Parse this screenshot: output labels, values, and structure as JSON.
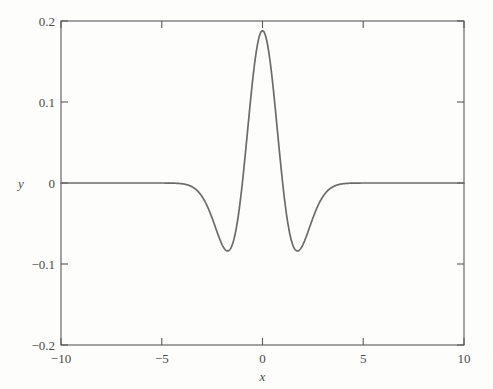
{
  "chart_data": {
    "type": "line",
    "title": "",
    "subtitle": "",
    "xlabel": "x",
    "ylabel": "y",
    "xlim": [
      -10,
      10
    ],
    "ylim": [
      -0.2,
      0.2
    ],
    "xticks": [
      -10,
      -5,
      0,
      5,
      10
    ],
    "xticklabels": [
      "−10",
      "−5",
      "0",
      "5",
      "10"
    ],
    "yticks": [
      -0.2,
      -0.1,
      0,
      0.1,
      0.2
    ],
    "yticklabels": [
      "−0.2",
      "−0.1",
      "0",
      "0.1",
      "0.2"
    ],
    "grid": false,
    "legend": null,
    "series": [
      {
        "name": "mexican-hat-wavelet",
        "color": "#6b6b6c",
        "linewidth": 1.7,
        "description": "Ricker (Mexican hat) wavelet: y = A(1 - (x/s)^2) exp(-x^2/(2 s^2)), A ≈ 0.1877, s ≈ 1.0; peak y ≈ 0.188 at x = 0; minima y ≈ −0.116 at x ≈ ±1.73; zero crossings at x ≈ ±1.0; tails → 0 beyond |x| ≈ 5",
        "peak": {
          "x": 0,
          "y": 0.188
        },
        "minima": [
          {
            "x": -1.73,
            "y": -0.116
          },
          {
            "x": 1.73,
            "y": -0.116
          }
        ],
        "zero_crossings": [
          -1.0,
          1.0
        ],
        "x": [
          -10,
          -9.5,
          -9,
          -8.5,
          -8,
          -7.5,
          -7,
          -6.5,
          -6,
          -5.5,
          -5,
          -4.75,
          -4.5,
          -4.25,
          -4,
          -3.75,
          -3.5,
          -3.25,
          -3,
          -2.8,
          -2.6,
          -2.4,
          -2.2,
          -2,
          -1.9,
          -1.8,
          -1.73,
          -1.6,
          -1.5,
          -1.4,
          -1.3,
          -1.2,
          -1.1,
          -1,
          -0.9,
          -0.8,
          -0.7,
          -0.6,
          -0.5,
          -0.4,
          -0.3,
          -0.2,
          -0.1,
          0,
          0.1,
          0.2,
          0.3,
          0.4,
          0.5,
          0.6,
          0.7,
          0.8,
          0.9,
          1,
          1.1,
          1.2,
          1.3,
          1.4,
          1.5,
          1.6,
          1.73,
          1.8,
          1.9,
          2,
          2.2,
          2.4,
          2.6,
          2.8,
          3,
          3.25,
          3.5,
          3.75,
          4,
          4.25,
          4.5,
          4.75,
          5,
          5.5,
          6,
          6.5,
          7,
          7.5,
          8,
          8.5,
          9,
          9.5,
          10
        ],
        "y": [
          0,
          0,
          0,
          0,
          0,
          0,
          0,
          0,
          0,
          -0.0001,
          -0.0004,
          -0.0007,
          -0.0013,
          -0.0023,
          -0.0038,
          -0.0062,
          -0.0096,
          -0.0143,
          -0.0206,
          -0.0266,
          -0.0334,
          -0.0407,
          -0.0479,
          -0.0544,
          -0.0571,
          -0.0592,
          -0.0601,
          -0.0606,
          -0.0598,
          -0.0577,
          -0.0542,
          -0.0489,
          -0.0417,
          -0.0325,
          -0.0211,
          -0.0076,
          0.0081,
          0.0259,
          0.0455,
          0.0667,
          0.0889,
          0.1117,
          0.1344,
          0.1877,
          0.1344,
          0.1117,
          0.0889,
          0.0667,
          0.0455,
          0.0259,
          0.0081,
          -0.0076,
          -0.0211,
          -0.0325,
          -0.0417,
          -0.0489,
          -0.0542,
          -0.0577,
          -0.0598,
          -0.0606,
          -0.0601,
          -0.0592,
          -0.0571,
          -0.0544,
          -0.0479,
          -0.0407,
          -0.0334,
          -0.0266,
          -0.0206,
          -0.0143,
          -0.0096,
          -0.0062,
          -0.0038,
          -0.0023,
          -0.0013,
          -0.0007,
          -0.0004,
          -0.0001,
          0,
          0,
          0,
          0,
          0,
          0,
          0,
          0,
          0
        ]
      }
    ]
  },
  "figure": {
    "background_color": "#fdfdfc",
    "axis_color": "#59595a",
    "text_color": "#4a4a4a",
    "curve_color": "#6b6b6c"
  }
}
